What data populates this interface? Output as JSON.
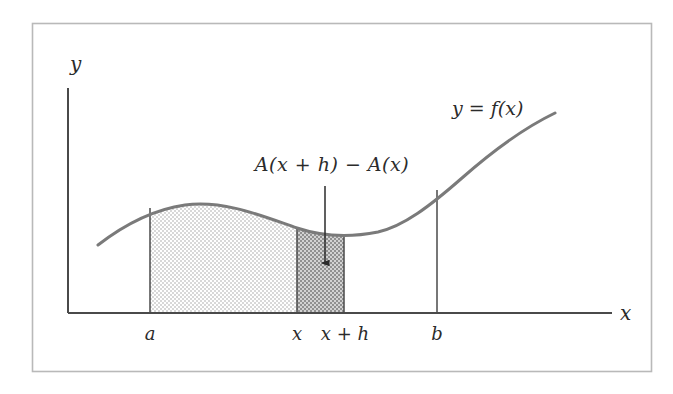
{
  "axes": {
    "y_label": "y",
    "x_label": "x",
    "origin": {
      "x": 68,
      "y": 313
    },
    "x_axis_end": 612,
    "y_axis_top": 88
  },
  "tick_labels": [
    {
      "name": "a",
      "text": "a",
      "x": 150
    },
    {
      "name": "x",
      "text": "x",
      "x": 297
    },
    {
      "name": "x-plus-h",
      "text": "x + h",
      "x": 345
    },
    {
      "name": "b",
      "text": "b",
      "x": 437
    }
  ],
  "curve": {
    "label": "y = f(x)",
    "label_x": 452,
    "label_y": 108,
    "stroke": "#7a7a7a",
    "stroke_width": 3,
    "path": "M 98 245 C 120 228 150 210 185 205 C 225 200 262 216 297 228 C 330 239 358 236 378 232 C 404 226 430 206 462 178 C 496 148 528 126 555 113"
  },
  "regions": [
    {
      "name": "light-area",
      "description": "A(x): area under curve from a to x",
      "fill": "#e9e9e9",
      "x_start": 150,
      "x_end": 297
    },
    {
      "name": "dark-strip",
      "description": "A(x + h) - A(x): strip from x to x+h",
      "fill": "#b4b4b4",
      "x_start": 297,
      "x_end": 344
    }
  ],
  "annotation": {
    "text": "A(x + h) − A(x)",
    "label_x": 332,
    "label_y": 163,
    "arrow_from_y": 186,
    "arrow_to_y": 266,
    "arrow_x": 325
  },
  "frame": {
    "left": 32,
    "top": 23,
    "right": 652,
    "bottom": 372,
    "stroke": "#b9b9b9"
  },
  "colors": {
    "ink": "#2b2b2b",
    "axis": "#4a4a4a",
    "curve": "#7a7a7a",
    "light_fill": "#e9e9e9",
    "dark_fill": "#b4b4b4",
    "frame": "#b9b9b9",
    "background": "#ffffff"
  }
}
